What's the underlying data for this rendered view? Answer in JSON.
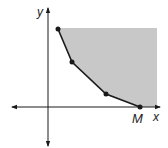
{
  "figure": {
    "axes": {
      "x_label": "x",
      "y_label": "y",
      "origin_px": [
        48,
        107
      ]
    },
    "vertices_px": [
      [
        58,
        29
      ],
      [
        72,
        62
      ],
      [
        106,
        94
      ],
      [
        140,
        107
      ]
    ],
    "point_label": "M",
    "region": {
      "fill_color": "#c8c8c8",
      "top_px": 28,
      "right_px": 157
    },
    "line_color": "#1a1a1a"
  }
}
